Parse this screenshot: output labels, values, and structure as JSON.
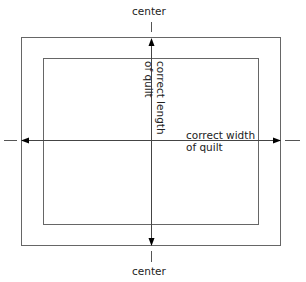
{
  "diagram": {
    "labels": {
      "center_top": "center",
      "center_bottom": "center",
      "width_line1": "correct width",
      "width_line2": "of quilt",
      "length_line1": "correct length",
      "length_line2": "of quilt"
    },
    "shapes": {
      "outer_border": {
        "x": 21,
        "y": 37,
        "w": 260,
        "h": 209
      },
      "inner_border": {
        "x": 43,
        "y": 58,
        "w": 216,
        "h": 167
      }
    },
    "colors": {
      "line": "#555555",
      "arrow": "#000000",
      "text": "#222222"
    }
  }
}
